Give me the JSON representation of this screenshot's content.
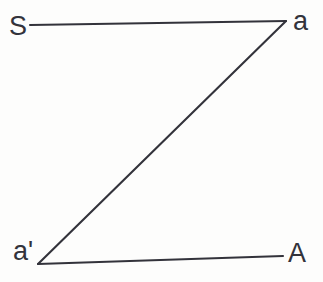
{
  "figure": {
    "background_color": "#fdfdfc",
    "stroke_color": "#33333b",
    "width": 323,
    "height": 282,
    "labels": {
      "top_left": "S",
      "top_right": "a",
      "bottom_left": "a'",
      "bottom_right": "A"
    },
    "segments": [
      {
        "name": "top-segment",
        "from_label": "S",
        "to_label": "a",
        "x1": 30,
        "y1": 25,
        "x2": 286,
        "y2": 21,
        "stroke_width": 2.1
      },
      {
        "name": "diagonal-segment",
        "from_label": "a",
        "to_label": "a'",
        "x1": 286,
        "y1": 21,
        "x2": 38,
        "y2": 264,
        "stroke_width": 2.1
      },
      {
        "name": "bottom-segment",
        "from_label": "a'",
        "to_label": "A",
        "x1": 38,
        "y1": 264,
        "x2": 283,
        "y2": 256,
        "stroke_width": 2.1
      }
    ]
  }
}
